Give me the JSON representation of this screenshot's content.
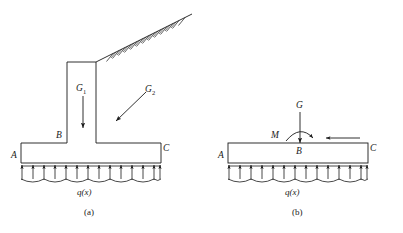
{
  "figure": {
    "background_color": "#ffffff",
    "line_color": "#1a1a1a",
    "width": 403,
    "height": 233
  },
  "panel_a": {
    "caption": "(a)",
    "description": "retaining-wall-free-body",
    "labels": {
      "point_a": "A",
      "point_b": "B",
      "point_c": "C",
      "self_weight": "G",
      "self_weight_sub": "1",
      "soil_weight": "G",
      "soil_weight_sub": "2",
      "distributed_load": "q(x)"
    },
    "reaction_arrow_count": 13,
    "hatch_mark_count": 14
  },
  "panel_b": {
    "caption": "(b)",
    "description": "equivalent-resultant-free-body",
    "labels": {
      "point_a": "A",
      "point_b": "B",
      "point_c": "C",
      "resultant_force": "G",
      "moment": "M",
      "distributed_load": "q(x)"
    },
    "reaction_arrow_count": 13
  }
}
